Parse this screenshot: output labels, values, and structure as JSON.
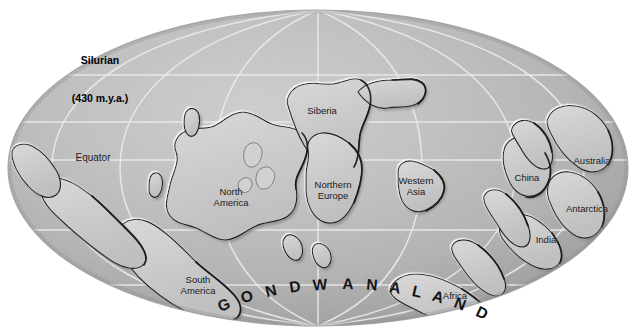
{
  "figure": {
    "kind": "paleogeographic-map",
    "projection": "elliptical (Mollweide-style) world map",
    "title_line1": "Silurian",
    "title_line2": "(430 m.y.a.)",
    "period": "Silurian",
    "age_label": "430 m.y.a.",
    "supercontinent_label": "GONDWANALAND"
  },
  "colors": {
    "page_background": "#ffffff",
    "ocean_light": "#c6c6c6",
    "ocean_mid": "#b8b8b8",
    "ocean_dark": "#9d9d9d",
    "ocean_edge": "#8d8d8d",
    "land_fill": "#cccccc",
    "land_highlight": "#f4f4f4",
    "land_shadow": "#2a2a2a",
    "graticule": "#eaeaea",
    "text": "#18181a",
    "title_text": "#000000"
  },
  "graticule": {
    "visible": true,
    "parallels_y": [
      75,
      122,
      160,
      230,
      285
    ],
    "equator_y": 160,
    "central_meridian_x": 318,
    "meridian_offsets": [
      -0.78,
      -0.52,
      -0.26,
      0,
      0.26,
      0.52,
      0.78
    ]
  },
  "ellipse": {
    "cx": 318,
    "cy": 168,
    "rx": 310,
    "ry": 158
  },
  "labels": [
    {
      "name": "equator",
      "text": "Equator",
      "x": 93,
      "y": 158,
      "lines": 1
    },
    {
      "name": "north-america",
      "text": "North\nAmerica",
      "x": 231,
      "y": 197,
      "lines": 2
    },
    {
      "name": "south-america",
      "text": "South\nAmerica",
      "x": 198,
      "y": 285,
      "lines": 2
    },
    {
      "name": "siberia",
      "text": "Siberia",
      "x": 322,
      "y": 111,
      "lines": 1
    },
    {
      "name": "northern-europe",
      "text": "Northern\nEurope",
      "x": 333,
      "y": 190,
      "lines": 2
    },
    {
      "name": "western-asia",
      "text": "Western\nAsia",
      "x": 416,
      "y": 186,
      "lines": 2
    },
    {
      "name": "china",
      "text": "China",
      "x": 527,
      "y": 178,
      "lines": 1
    },
    {
      "name": "australia",
      "text": "Australia",
      "x": 592,
      "y": 161,
      "lines": 1
    },
    {
      "name": "antarctica",
      "text": "Antarctica",
      "x": 587,
      "y": 209,
      "lines": 1
    },
    {
      "name": "india",
      "text": "India",
      "x": 546,
      "y": 240,
      "lines": 1
    },
    {
      "name": "africa",
      "text": "Africa",
      "x": 455,
      "y": 296,
      "lines": 1
    }
  ],
  "gondwanaland": {
    "text": "GONDWANALAND",
    "letters": [
      {
        "ch": "G",
        "x": 224,
        "y": 305,
        "rot": -22
      },
      {
        "ch": "O",
        "x": 247,
        "y": 297,
        "rot": -18
      },
      {
        "ch": "N",
        "x": 271,
        "y": 291,
        "rot": -14
      },
      {
        "ch": "D",
        "x": 295,
        "y": 287,
        "rot": -9
      },
      {
        "ch": "W",
        "x": 320,
        "y": 285,
        "rot": -4
      },
      {
        "ch": "A",
        "x": 348,
        "y": 284,
        "rot": 1
      },
      {
        "ch": "N",
        "x": 372,
        "y": 285,
        "rot": 5
      },
      {
        "ch": "A",
        "x": 395,
        "y": 288,
        "rot": 9
      },
      {
        "ch": "L",
        "x": 417,
        "y": 292,
        "rot": 13
      },
      {
        "ch": "A",
        "x": 438,
        "y": 297,
        "rot": 17
      },
      {
        "ch": "N",
        "x": 460,
        "y": 304,
        "rot": 21
      },
      {
        "ch": "D",
        "x": 482,
        "y": 313,
        "rot": 25
      }
    ]
  },
  "continents": [
    {
      "name": "laurentia-north-america"
    },
    {
      "name": "baltica-northern-europe"
    },
    {
      "name": "siberia-craton"
    },
    {
      "name": "western-asia-block"
    },
    {
      "name": "china-block"
    },
    {
      "name": "gondwana-south-america"
    },
    {
      "name": "gondwana-africa"
    },
    {
      "name": "gondwana-india"
    },
    {
      "name": "gondwana-antarctica"
    },
    {
      "name": "gondwana-australia"
    }
  ]
}
